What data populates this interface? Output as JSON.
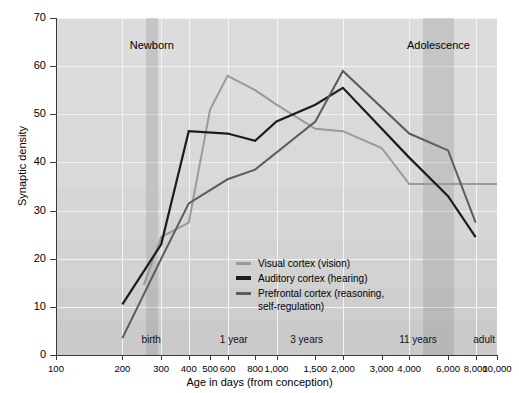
{
  "chart_data": {
    "type": "line",
    "title": "",
    "xlabel": "Age in days (from conception)",
    "ylabel": "Synaptic density",
    "xscale": "log",
    "xlim": [
      100,
      10000
    ],
    "ylim": [
      0,
      70
    ],
    "grid": true,
    "legend_position": "inside-center",
    "x_tick_labels": [
      "100",
      "200",
      "300",
      "400",
      "500",
      "600",
      "800",
      "1,000",
      "1,500",
      "2,000",
      "3,000",
      "4,000",
      "6,000",
      "8,000",
      "10,000"
    ],
    "x_tick_values": [
      100,
      200,
      300,
      400,
      500,
      600,
      800,
      1000,
      1500,
      2000,
      3000,
      4000,
      6000,
      8000,
      10000
    ],
    "y_tick_labels": [
      "0",
      "10",
      "20",
      "30",
      "40",
      "50",
      "60",
      "70"
    ],
    "y_tick_values": [
      0,
      10,
      20,
      30,
      40,
      50,
      60,
      70
    ],
    "stage_markers": [
      {
        "label": "birth",
        "x": 270
      },
      {
        "label": "1 year",
        "x": 640
      },
      {
        "label": "3 years",
        "x": 1370
      },
      {
        "label": "11 years",
        "x": 4380
      },
      {
        "label": "adult",
        "x": 10000
      }
    ],
    "shaded_regions": [
      {
        "label": "Newborn",
        "x_start": 255,
        "x_end": 290,
        "color": "#bdbdbd"
      },
      {
        "label": "Adolescence",
        "x_start": 4600,
        "x_end": 6400,
        "color": "#bdbdbd"
      }
    ],
    "series": [
      {
        "name": "Visual cortex (vision)",
        "color": "#9a9a9a",
        "x": [
          250,
          300,
          400,
          500,
          600,
          800,
          1000,
          1500,
          2000,
          3000,
          4000,
          10000
        ],
        "values": [
          14.5,
          24.5,
          27.5,
          51,
          58,
          55,
          52,
          47,
          46.5,
          43,
          35.5,
          35.5
        ]
      },
      {
        "name": "Auditory cortex (hearing)",
        "color": "#1c1c1c",
        "x": [
          200,
          300,
          400,
          600,
          800,
          1000,
          1500,
          2000,
          4000,
          6000,
          8000
        ],
        "values": [
          10.5,
          23,
          46.5,
          46,
          44.5,
          48.5,
          52,
          55.5,
          41,
          33,
          24.5
        ]
      },
      {
        "name": "Prefrontal cortex (reasoning,\nself-regulation)",
        "color": "#5c5c5c",
        "x": [
          200,
          300,
          400,
          600,
          800,
          1500,
          2000,
          4000,
          6000,
          8000
        ],
        "values": [
          3.5,
          20,
          31.5,
          36.5,
          38.5,
          48.5,
          59,
          46,
          42.5,
          27.5
        ]
      }
    ]
  },
  "legend": {
    "items": [
      {
        "label": "Visual cortex (vision)",
        "color": "#9a9a9a"
      },
      {
        "label": "Auditory cortex (hearing)",
        "color": "#1c1c1c"
      },
      {
        "label": "Prefrontal cortex (reasoning,\nself-regulation)",
        "color": "#5c5c5c"
      }
    ]
  },
  "axes": {
    "x_title": "Age in days (from conception)",
    "y_title": "Synaptic density"
  }
}
